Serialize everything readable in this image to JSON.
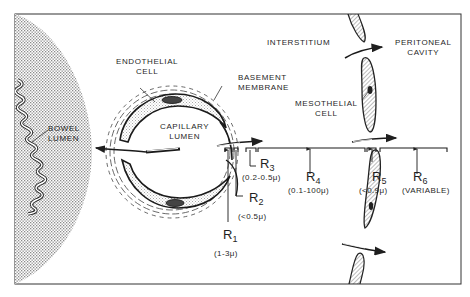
{
  "diagram": {
    "regions": {
      "bowel_lumen": "BOWEL\nLUMEN",
      "interstitium": "INTERSTITIUM",
      "peritoneal_cavity": "PERITONEAL\nCAVITY"
    },
    "structures": {
      "endothelial_cell": "ENDOTHELIAL\nCELL",
      "basement_membrane": "BASEMENT\nMEMBRANE",
      "capillary_lumen": "CAPILLARY\nLUMEN",
      "mesothelial_cell": "MESOTHELIAL\nCELL"
    },
    "resistances": [
      {
        "id": "R1",
        "symbol": "R",
        "sub": "1",
        "range": "(1-3μ)"
      },
      {
        "id": "R2",
        "symbol": "R",
        "sub": "2",
        "range": "(<0.5μ)"
      },
      {
        "id": "R3",
        "symbol": "R",
        "sub": "3",
        "range": "(0.2-0.5μ)"
      },
      {
        "id": "R4",
        "symbol": "R",
        "sub": "4",
        "range": "(0.1-100μ)"
      },
      {
        "id": "R5",
        "symbol": "R",
        "sub": "5",
        "range": "(<0.9μ)"
      },
      {
        "id": "R6",
        "symbol": "R",
        "sub": "6",
        "range": "(VARIABLE)"
      }
    ],
    "colors": {
      "ink": "#1f1f1f",
      "stipple": "#9a9a9a",
      "background": "#ffffff"
    }
  }
}
